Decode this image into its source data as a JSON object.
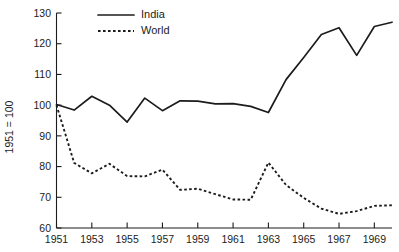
{
  "chart_data": {
    "type": "line",
    "title": "",
    "subtitle": "",
    "xlabel": "",
    "ylabel": "1951 = 100",
    "xlim": [
      1951,
      1970
    ],
    "ylim": [
      60,
      130
    ],
    "grid": false,
    "legend_position": "top-left",
    "y_ticks": [
      60,
      70,
      80,
      90,
      100,
      110,
      120,
      130
    ],
    "y_tick_labels": [
      "60",
      "70",
      "80",
      "90",
      "100",
      "110",
      "120",
      "130"
    ],
    "x_ticks": [
      1951,
      1953,
      1955,
      1957,
      1959,
      1961,
      1963,
      1965,
      1967,
      1969
    ],
    "x_tick_labels": [
      "1951",
      "1953",
      "1955",
      "1957",
      "1959",
      "1961",
      "1963",
      "1965",
      "1967",
      "1969"
    ],
    "x": [
      1951,
      1952,
      1953,
      1954,
      1955,
      1956,
      1957,
      1958,
      1959,
      1960,
      1961,
      1962,
      1963,
      1964,
      1965,
      1966,
      1967,
      1968,
      1969,
      1970
    ],
    "series": [
      {
        "name": "India",
        "style": "solid",
        "color": "#1c1c1c",
        "values": [
          100.2,
          98.4,
          102.9,
          100.0,
          94.5,
          102.3,
          98.2,
          101.4,
          101.3,
          100.4,
          100.5,
          99.6,
          97.6,
          108.3,
          115.5,
          123.0,
          125.2,
          116.2,
          125.6,
          127.0
        ]
      },
      {
        "name": "World",
        "style": "dotted",
        "color": "#1c1c1c",
        "values": [
          100.0,
          81.2,
          77.8,
          80.9,
          76.9,
          76.8,
          79.0,
          72.4,
          72.8,
          71.0,
          69.3,
          69.2,
          81.3,
          74.0,
          69.8,
          66.3,
          64.6,
          65.5,
          67.2,
          67.4
        ]
      }
    ]
  },
  "legend": {
    "entries": [
      {
        "label": "India",
        "style": "solid"
      },
      {
        "label": "World",
        "style": "dotted"
      }
    ]
  }
}
